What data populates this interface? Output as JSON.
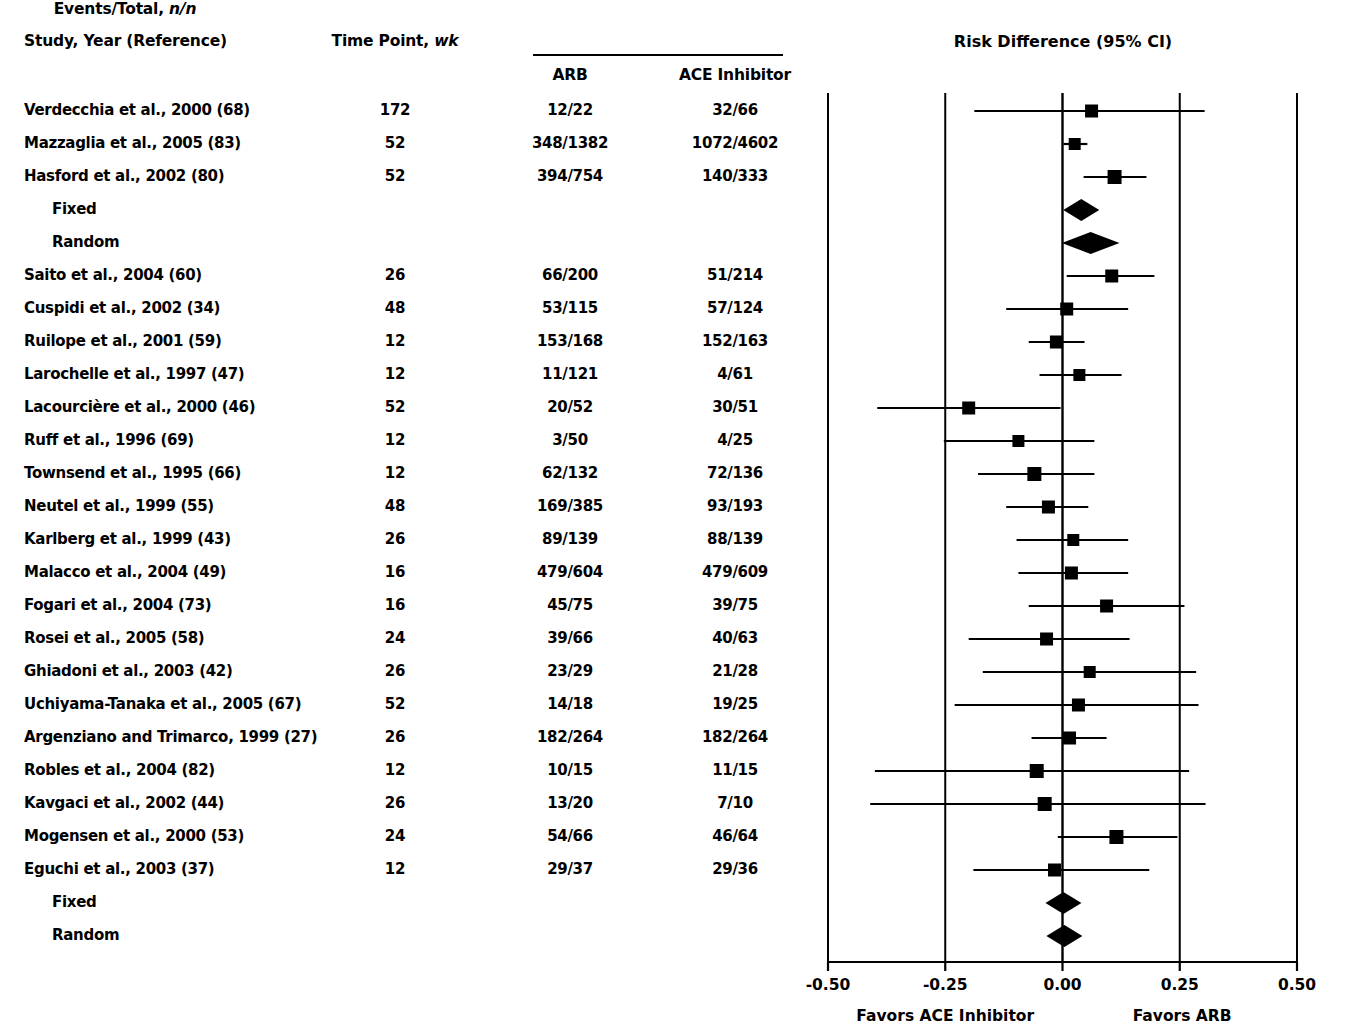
{
  "headers": {
    "study": "Study, Year (Reference)",
    "time_point": "Time Point, ",
    "time_point_unit": "wk",
    "events_total": "Events/Total, ",
    "events_total_unit": "n/n",
    "arb": "ARB",
    "ace": "ACE Inhibitor",
    "plot_title": "Risk Difference (95% CI)"
  },
  "footer": {
    "favors_left": "Favors ACE Inhibitor",
    "favors_right": "Favors ARB"
  },
  "axis": {
    "ticks": [
      "-0.50",
      "-0.25",
      "0.00",
      "0.25",
      "0.50"
    ],
    "tick_values": [
      -0.5,
      -0.25,
      0.0,
      0.25,
      0.5
    ],
    "min": -0.5,
    "max": 0.5
  },
  "colors": {
    "ink": "#000000",
    "background": "#ffffff"
  },
  "chart_data": {
    "type": "forest",
    "title": "Risk Difference (95% CI)",
    "xlabel": "Risk Difference",
    "xlim": [
      -0.5,
      0.5
    ],
    "xticks": [
      -0.5,
      -0.25,
      0.0,
      0.25,
      0.5
    ],
    "xticklabels": [
      "-0.50",
      "-0.25",
      "0.00",
      "0.25",
      "0.50"
    ],
    "grid": false,
    "columns": [
      "Study, Year (Reference)",
      "Time Point, wk",
      "ARB",
      "ACE Inhibitor",
      "Risk Difference (95% CI)"
    ],
    "rows": [
      {
        "study": "Verdecchia et al., 2000 (68)",
        "time": "172",
        "arb": "12/22",
        "ace": "32/66",
        "marker": "square",
        "effect": 0.062,
        "ci_low": -0.188,
        "ci_high": 0.303,
        "box": 13,
        "indent": false
      },
      {
        "study": "Mazzaglia et al., 2005 (83)",
        "time": "52",
        "arb": "348/1382",
        "ace": "1072/4602",
        "marker": "square",
        "effect": 0.026,
        "ci_low": 0.002,
        "ci_high": 0.053,
        "box": 12,
        "indent": false
      },
      {
        "study": "Hasford et al., 2002 (80)",
        "time": "52",
        "arb": "394/754",
        "ace": "140/333",
        "marker": "square",
        "effect": 0.111,
        "ci_low": 0.045,
        "ci_high": 0.179,
        "box": 14,
        "indent": false
      },
      {
        "study": "Fixed",
        "time": "",
        "arb": "",
        "ace": "",
        "marker": "diamond",
        "effect": 0.04,
        "ci_low": 0.012,
        "ci_high": 0.068,
        "box": 0,
        "indent": true
      },
      {
        "study": "Random",
        "time": "",
        "arb": "",
        "ace": "",
        "marker": "diamond",
        "effect": 0.06,
        "ci_low": -0.001,
        "ci_high": 0.122,
        "box": 0,
        "indent": true
      },
      {
        "study": "Saito et al., 2004 (60)",
        "time": "26",
        "arb": "66/200",
        "ace": "51/214",
        "marker": "square",
        "effect": 0.105,
        "ci_low": 0.009,
        "ci_high": 0.196,
        "box": 13,
        "indent": false
      },
      {
        "study": "Cuspidi et al., 2002 (34)",
        "time": "48",
        "arb": "53/115",
        "ace": "57/124",
        "marker": "square",
        "effect": 0.009,
        "ci_low": -0.12,
        "ci_high": 0.14,
        "box": 13,
        "indent": false
      },
      {
        "study": "Ruilope et al., 2001 (59)",
        "time": "12",
        "arb": "153/168",
        "ace": "152/163",
        "marker": "square",
        "effect": -0.013,
        "ci_low": -0.072,
        "ci_high": 0.047,
        "box": 13,
        "indent": false
      },
      {
        "study": "Larochelle et al., 1997 (47)",
        "time": "12",
        "arb": "11/121",
        "ace": "4/61",
        "marker": "square",
        "effect": 0.036,
        "ci_low": -0.049,
        "ci_high": 0.126,
        "box": 12,
        "indent": false
      },
      {
        "study": "Lacourcière et al., 2000 (46)",
        "time": "52",
        "arb": "20/52",
        "ace": "30/51",
        "marker": "square",
        "effect": -0.2,
        "ci_low": -0.395,
        "ci_high": -0.004,
        "box": 13,
        "indent": false
      },
      {
        "study": "Ruff et al., 1996 (69)",
        "time": "12",
        "arb": "3/50",
        "ace": "4/25",
        "marker": "square",
        "effect": -0.094,
        "ci_low": -0.253,
        "ci_high": 0.068,
        "box": 12,
        "indent": false
      },
      {
        "study": "Townsend et al., 1995 (66)",
        "time": "12",
        "arb": "62/132",
        "ace": "72/136",
        "marker": "square",
        "effect": -0.06,
        "ci_low": -0.18,
        "ci_high": 0.068,
        "box": 14,
        "indent": false
      },
      {
        "study": "Neutel et al., 1999 (55)",
        "time": "48",
        "arb": "169/385",
        "ace": "93/193",
        "marker": "square",
        "effect": -0.03,
        "ci_low": -0.12,
        "ci_high": 0.055,
        "box": 13,
        "indent": false
      },
      {
        "study": "Karlberg et al., 1999 (43)",
        "time": "26",
        "arb": "89/139",
        "ace": "88/139",
        "marker": "square",
        "effect": 0.023,
        "ci_low": -0.098,
        "ci_high": 0.14,
        "box": 12,
        "indent": false
      },
      {
        "study": "Malacco et al., 2004 (49)",
        "time": "16",
        "arb": "479/604",
        "ace": "479/609",
        "marker": "square",
        "effect": 0.019,
        "ci_low": -0.094,
        "ci_high": 0.14,
        "box": 13,
        "indent": false
      },
      {
        "study": "Fogari et al., 2004 (73)",
        "time": "16",
        "arb": "45/75",
        "ace": "39/75",
        "marker": "square",
        "effect": 0.094,
        "ci_low": -0.072,
        "ci_high": 0.26,
        "box": 13,
        "indent": false
      },
      {
        "study": "Rosei et al., 2005 (58)",
        "time": "24",
        "arb": "39/66",
        "ace": "40/63",
        "marker": "square",
        "effect": -0.034,
        "ci_low": -0.2,
        "ci_high": 0.143,
        "box": 13,
        "indent": false
      },
      {
        "study": "Ghiadoni et al., 2003 (42)",
        "time": "26",
        "arb": "23/29",
        "ace": "21/28",
        "marker": "square",
        "effect": 0.058,
        "ci_low": -0.17,
        "ci_high": 0.285,
        "box": 12,
        "indent": false
      },
      {
        "study": "Uchiyama-Tanaka et al., 2005 (67)",
        "time": "52",
        "arb": "14/18",
        "ace": "19/25",
        "marker": "square",
        "effect": 0.034,
        "ci_low": -0.23,
        "ci_high": 0.29,
        "box": 13,
        "indent": false
      },
      {
        "study": "Argenziano and Trimarco, 1999 (27)",
        "time": "26",
        "arb": "182/264",
        "ace": "182/264",
        "marker": "square",
        "effect": 0.015,
        "ci_low": -0.066,
        "ci_high": 0.094,
        "box": 13,
        "indent": false
      },
      {
        "study": "Robles et al., 2004 (82)",
        "time": "12",
        "arb": "10/15",
        "ace": "11/15",
        "marker": "square",
        "effect": -0.055,
        "ci_low": -0.4,
        "ci_high": 0.27,
        "box": 14,
        "indent": false
      },
      {
        "study": "Kavgaci et al., 2002 (44)",
        "time": "26",
        "arb": "13/20",
        "ace": "7/10",
        "marker": "square",
        "effect": -0.038,
        "ci_low": -0.41,
        "ci_high": 0.305,
        "box": 14,
        "indent": false
      },
      {
        "study": "Mogensen et al., 2000 (53)",
        "time": "24",
        "arb": "54/66",
        "ace": "46/64",
        "marker": "square",
        "effect": 0.115,
        "ci_low": -0.01,
        "ci_high": 0.245,
        "box": 14,
        "indent": false
      },
      {
        "study": "Eguchi et al., 2003 (37)",
        "time": "12",
        "arb": "29/37",
        "ace": "29/36",
        "marker": "square",
        "effect": -0.017,
        "ci_low": -0.19,
        "ci_high": 0.185,
        "box": 13,
        "indent": false
      },
      {
        "study": "Fixed",
        "time": "",
        "arb": "",
        "ace": "",
        "marker": "diamond",
        "effect": 0.002,
        "ci_low": -0.02,
        "ci_high": 0.026,
        "box": 0,
        "indent": true
      },
      {
        "study": "Random",
        "time": "",
        "arb": "",
        "ace": "",
        "marker": "diamond",
        "effect": 0.004,
        "ci_low": -0.02,
        "ci_high": 0.03,
        "box": 0,
        "indent": true
      }
    ]
  },
  "layout": {
    "row_y": [
      111,
      144,
      177,
      210,
      243,
      276,
      309,
      342,
      375,
      408,
      441,
      474,
      507,
      540,
      573,
      606,
      639,
      672,
      705,
      738,
      771,
      804,
      837,
      870,
      903,
      936
    ],
    "axis_x_pixels": {
      "-0.5": 828,
      "-0.25": 943,
      "0": 1061,
      "0.25": 1178,
      "0.5": 1297
    },
    "plot_top": 93,
    "plot_bottom": 962
  }
}
